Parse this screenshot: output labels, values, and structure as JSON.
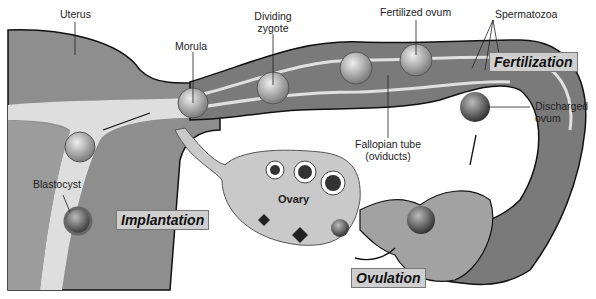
{
  "diagram": {
    "labels": {
      "uterus": "Uterus",
      "morula": "Morula",
      "dividing_zygote_line1": "Dividing",
      "dividing_zygote_line2": "zygote",
      "fertilized_ovum": "Fertilized ovum",
      "spermatozoa": "Spermatozoa",
      "fallopian_line1": "Fallopian tube",
      "fallopian_line2": "(oviducts)",
      "discharged_line1": "Discharged",
      "discharged_line2": "ovum",
      "blastocyst": "Blastocyst",
      "ovary": "Ovary"
    },
    "stages": {
      "fertilization": "Fertilization",
      "implantation": "Implantation",
      "ovulation": "Ovulation"
    },
    "colors": {
      "tissue_dark": "#6e6e6e",
      "tissue_mid": "#9a9a9a",
      "tissue_light": "#c8c8c8",
      "lining": "#e6e6e6",
      "stage_box": "#cfcfcf",
      "outline": "#111111"
    }
  }
}
